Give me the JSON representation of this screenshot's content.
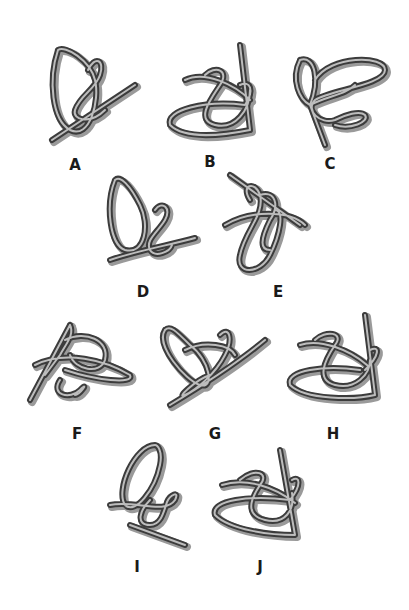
{
  "figure": {
    "colors": {
      "rope_dark": "#3c3c3c",
      "rope_light": "#bdbdbd",
      "shadow": "#9a9a9a",
      "label": "#1a1a1a",
      "background": "#ffffff"
    },
    "items": [
      {
        "label": "A",
        "x": 40,
        "y": 40,
        "label_x": 60,
        "label_y": 156
      },
      {
        "label": "B",
        "x": 165,
        "y": 40,
        "label_x": 195,
        "label_y": 153
      },
      {
        "label": "C",
        "x": 290,
        "y": 50,
        "label_x": 315,
        "label_y": 155
      },
      {
        "label": "D",
        "x": 100,
        "y": 170,
        "label_x": 128,
        "label_y": 283
      },
      {
        "label": "E",
        "x": 220,
        "y": 170,
        "label_x": 263,
        "label_y": 283
      },
      {
        "label": "F",
        "x": 25,
        "y": 320,
        "label_x": 62,
        "label_y": 425
      },
      {
        "label": "G",
        "x": 155,
        "y": 320,
        "label_x": 200,
        "label_y": 425
      },
      {
        "label": "H",
        "x": 285,
        "y": 310,
        "label_x": 318,
        "label_y": 425
      },
      {
        "label": "I",
        "x": 105,
        "y": 440,
        "label_x": 122,
        "label_y": 558
      },
      {
        "label": "J",
        "x": 210,
        "y": 445,
        "label_x": 245,
        "label_y": 558
      }
    ]
  }
}
